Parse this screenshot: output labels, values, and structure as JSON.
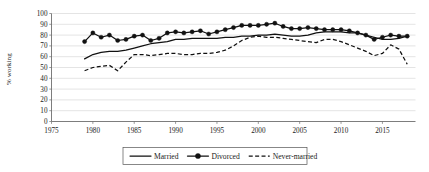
{
  "chart_data": {
    "type": "line",
    "title": "",
    "xlabel": "",
    "ylabel": "% working",
    "xlim": [
      1975,
      2019
    ],
    "ylim": [
      0,
      100
    ],
    "xticks": [
      1975,
      1980,
      1985,
      1990,
      1995,
      2000,
      2005,
      2010,
      2015
    ],
    "yticks": [
      0,
      10,
      20,
      30,
      40,
      50,
      60,
      70,
      80,
      90,
      100
    ],
    "grid": true,
    "legend_position": "bottom",
    "x": [
      1979,
      1980,
      1981,
      1982,
      1983,
      1984,
      1985,
      1986,
      1987,
      1988,
      1989,
      1990,
      1991,
      1992,
      1993,
      1994,
      1995,
      1996,
      1997,
      1998,
      1999,
      2000,
      2001,
      2002,
      2003,
      2004,
      2005,
      2006,
      2007,
      2008,
      2009,
      2010,
      2011,
      2012,
      2013,
      2014,
      2015,
      2016,
      2017,
      2018
    ],
    "series": [
      {
        "name": "Married",
        "style": "solid",
        "marker": "none",
        "values": [
          58,
          62,
          64,
          65,
          65,
          66,
          68,
          70,
          72,
          73,
          74,
          76,
          76,
          77,
          77,
          77,
          77,
          78,
          78,
          79,
          79,
          80,
          80,
          81,
          80,
          79,
          79,
          80,
          82,
          83,
          83,
          83,
          82,
          82,
          80,
          78,
          76,
          76,
          77,
          79
        ]
      },
      {
        "name": "Divorced",
        "style": "solid",
        "marker": "circle",
        "values": [
          74,
          82,
          78,
          80,
          75,
          76,
          79,
          80,
          75,
          77,
          82,
          83,
          82,
          83,
          84,
          81,
          83,
          85,
          87,
          89,
          89,
          89,
          90,
          91,
          88,
          86,
          86,
          87,
          86,
          85,
          85,
          85,
          84,
          82,
          80,
          76,
          78,
          80,
          79,
          79
        ]
      },
      {
        "name": "Never-married",
        "style": "dashed",
        "marker": "none",
        "values": [
          47,
          50,
          51,
          52,
          47,
          55,
          62,
          62,
          61,
          62,
          63,
          63,
          62,
          62,
          63,
          63,
          64,
          66,
          70,
          75,
          78,
          79,
          78,
          78,
          77,
          76,
          75,
          74,
          73,
          76,
          76,
          74,
          71,
          68,
          65,
          61,
          63,
          71,
          67,
          53
        ]
      }
    ]
  },
  "legend": {
    "items": [
      {
        "label": "Married",
        "key": "married"
      },
      {
        "label": "Divorced",
        "key": "divorced"
      },
      {
        "label": "Never-married",
        "key": "never-married"
      }
    ]
  },
  "colors": {
    "line": "#111111",
    "grid": "#c9c9c9",
    "axis": "#6e6e6e",
    "background": "#ffffff"
  }
}
